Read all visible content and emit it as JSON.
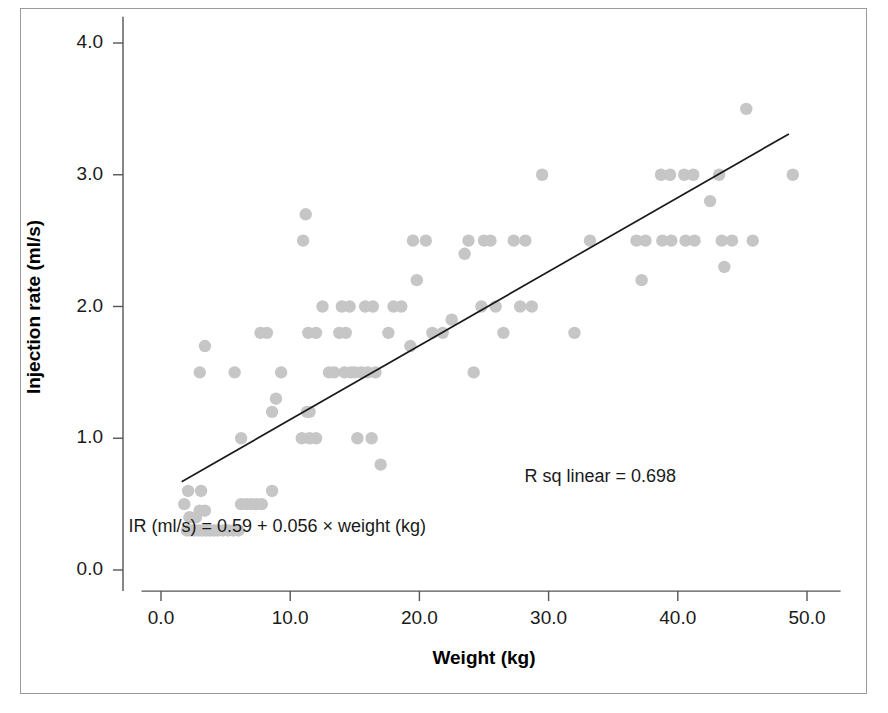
{
  "chart_data": {
    "type": "scatter",
    "title": "",
    "xlabel": "Weight (kg)",
    "ylabel": "Injection rate (ml/s)",
    "xlim": [
      -1.5,
      53.0
    ],
    "ylim": [
      -0.2,
      4.2
    ],
    "xticks": [
      0.0,
      10.0,
      20.0,
      30.0,
      40.0,
      50.0
    ],
    "yticks": [
      0.0,
      1.0,
      2.0,
      3.0,
      4.0
    ],
    "xtick_labels": [
      "0.0",
      "10.0",
      "20.0",
      "30.0",
      "40.0",
      "50.0"
    ],
    "ytick_labels": [
      "0.0",
      "1.0",
      "2.0",
      "3.0",
      "4.0"
    ],
    "grid": false,
    "legend": null,
    "marker_color": "#c6c6c6",
    "line_color": "#1a1a1a",
    "axis_color": "#555555",
    "annotations": [
      {
        "name": "r-squared-annotation",
        "text": "R sq linear = 0.698",
        "x": 34.0,
        "y": 0.7
      },
      {
        "name": "regression-equation-annotation",
        "text": "IR (ml/s) = 0.59 + 0.056 × weight (kg)",
        "x": 9.0,
        "y": 0.32
      }
    ],
    "fit_line": {
      "name": "linear-fit-line",
      "intercept": 0.59,
      "slope": 0.056,
      "r_squared": 0.698,
      "x_start": 1.6,
      "x_end": 48.6,
      "y_start": 0.67,
      "y_end": 3.31
    },
    "series": [
      {
        "name": "injection-rate-vs-weight",
        "points": [
          [
            1.8,
            0.5
          ],
          [
            2.0,
            0.3
          ],
          [
            2.3,
            0.3
          ],
          [
            2.6,
            0.3
          ],
          [
            2.9,
            0.3
          ],
          [
            3.2,
            0.3
          ],
          [
            3.5,
            0.3
          ],
          [
            3.8,
            0.3
          ],
          [
            4.1,
            0.3
          ],
          [
            4.4,
            0.3
          ],
          [
            4.8,
            0.3
          ],
          [
            5.2,
            0.3
          ],
          [
            5.6,
            0.3
          ],
          [
            6.0,
            0.3
          ],
          [
            2.2,
            0.4
          ],
          [
            2.7,
            0.4
          ],
          [
            3.0,
            0.45
          ],
          [
            3.4,
            0.45
          ],
          [
            2.1,
            0.6
          ],
          [
            3.1,
            0.6
          ],
          [
            6.2,
            0.5
          ],
          [
            6.6,
            0.5
          ],
          [
            7.0,
            0.5
          ],
          [
            7.4,
            0.5
          ],
          [
            7.8,
            0.5
          ],
          [
            8.6,
            0.6
          ],
          [
            3.0,
            1.5
          ],
          [
            3.4,
            1.7
          ],
          [
            5.7,
            1.5
          ],
          [
            6.2,
            1.0
          ],
          [
            7.7,
            1.8
          ],
          [
            8.2,
            1.8
          ],
          [
            8.6,
            1.2
          ],
          [
            8.9,
            1.3
          ],
          [
            9.3,
            1.5
          ],
          [
            11.0,
            2.5
          ],
          [
            11.2,
            2.7
          ],
          [
            11.3,
            1.2
          ],
          [
            11.5,
            1.2
          ],
          [
            10.9,
            1.0
          ],
          [
            11.5,
            1.0
          ],
          [
            12.0,
            1.0
          ],
          [
            11.4,
            1.8
          ],
          [
            12.0,
            1.8
          ],
          [
            12.5,
            2.0
          ],
          [
            13.0,
            1.5
          ],
          [
            13.4,
            1.5
          ],
          [
            13.8,
            1.8
          ],
          [
            14.3,
            1.8
          ],
          [
            14.0,
            2.0
          ],
          [
            14.6,
            2.0
          ],
          [
            14.2,
            1.5
          ],
          [
            14.7,
            1.5
          ],
          [
            15.0,
            1.5
          ],
          [
            15.2,
            1.0
          ],
          [
            16.3,
            1.0
          ],
          [
            15.8,
            2.0
          ],
          [
            16.4,
            2.0
          ],
          [
            15.5,
            1.5
          ],
          [
            16.0,
            1.5
          ],
          [
            16.6,
            1.5
          ],
          [
            17.0,
            0.8
          ],
          [
            17.6,
            1.8
          ],
          [
            18.0,
            2.0
          ],
          [
            18.6,
            2.0
          ],
          [
            19.3,
            1.7
          ],
          [
            19.8,
            2.2
          ],
          [
            19.5,
            2.5
          ],
          [
            20.5,
            2.5
          ],
          [
            21.0,
            1.8
          ],
          [
            21.8,
            1.8
          ],
          [
            22.5,
            1.9
          ],
          [
            23.5,
            2.4
          ],
          [
            23.8,
            2.5
          ],
          [
            24.2,
            1.5
          ],
          [
            25.0,
            2.5
          ],
          [
            25.5,
            2.5
          ],
          [
            24.8,
            2.0
          ],
          [
            25.9,
            2.0
          ],
          [
            26.5,
            1.8
          ],
          [
            27.3,
            2.5
          ],
          [
            28.2,
            2.5
          ],
          [
            27.8,
            2.0
          ],
          [
            28.7,
            2.0
          ],
          [
            29.5,
            3.0
          ],
          [
            32.0,
            1.8
          ],
          [
            33.2,
            2.5
          ],
          [
            36.8,
            2.5
          ],
          [
            37.5,
            2.5
          ],
          [
            37.2,
            2.2
          ],
          [
            38.7,
            3.0
          ],
          [
            39.4,
            3.0
          ],
          [
            38.8,
            2.5
          ],
          [
            39.5,
            2.5
          ],
          [
            40.5,
            3.0
          ],
          [
            41.2,
            3.0
          ],
          [
            40.6,
            2.5
          ],
          [
            41.3,
            2.5
          ],
          [
            42.5,
            2.8
          ],
          [
            43.2,
            3.0
          ],
          [
            43.4,
            2.5
          ],
          [
            44.2,
            2.5
          ],
          [
            43.6,
            2.3
          ],
          [
            45.3,
            3.5
          ],
          [
            45.8,
            2.5
          ],
          [
            48.9,
            3.0
          ]
        ]
      }
    ]
  }
}
